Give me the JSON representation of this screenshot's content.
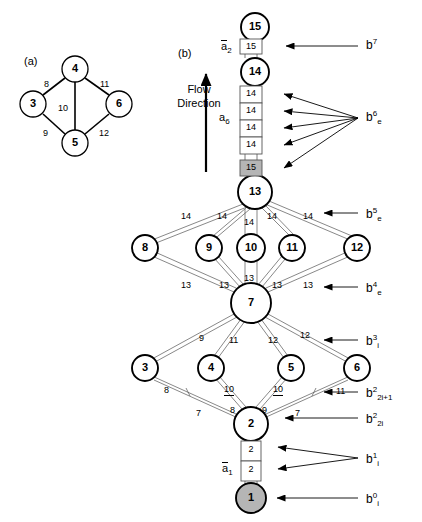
{
  "figure": {
    "panels": [
      {
        "tag": "(a)",
        "x": 24,
        "y": 56
      },
      {
        "tag": "(b)",
        "x": 178,
        "y": 48
      }
    ],
    "flow_label_line1": "Flow",
    "flow_label_line2": "Direction"
  },
  "panel_a": {
    "nodes": [
      {
        "id": "4",
        "cx": 75,
        "cy": 69,
        "r": 13
      },
      {
        "id": "3",
        "cx": 33,
        "cy": 104,
        "r": 13
      },
      {
        "id": "6",
        "cx": 119,
        "cy": 104,
        "r": 13
      },
      {
        "id": "5",
        "cx": 75,
        "cy": 143,
        "r": 13
      }
    ],
    "edges": [
      {
        "from": "3",
        "to": "4",
        "label": "8",
        "lx": 44,
        "ly": 80
      },
      {
        "from": "4",
        "to": "6",
        "label": "11",
        "lx": 100,
        "ly": 80
      },
      {
        "from": "4",
        "to": "5",
        "label": "10",
        "lx": 58,
        "ly": 104
      },
      {
        "from": "3",
        "to": "5",
        "label": "9",
        "lx": 43,
        "ly": 129
      },
      {
        "from": "5",
        "to": "6",
        "label": "12",
        "lx": 99,
        "ly": 129
      }
    ]
  },
  "panel_b": {
    "nodes": [
      {
        "id": "15",
        "cx": 255,
        "cy": 27,
        "r": 14,
        "fill": "white"
      },
      {
        "id": "14",
        "cx": 255,
        "cy": 72,
        "r": 14,
        "fill": "white"
      },
      {
        "id": "13",
        "cx": 255,
        "cy": 192,
        "r": 17,
        "fill": "white"
      },
      {
        "id": "8",
        "cx": 145,
        "cy": 248,
        "r": 13,
        "fill": "white"
      },
      {
        "id": "9",
        "cx": 209,
        "cy": 248,
        "r": 13,
        "fill": "white"
      },
      {
        "id": "10",
        "cx": 251,
        "cy": 248,
        "r": 14,
        "fill": "white"
      },
      {
        "id": "11",
        "cx": 292,
        "cy": 248,
        "r": 13,
        "fill": "white"
      },
      {
        "id": "12",
        "cx": 357,
        "cy": 248,
        "r": 13,
        "fill": "white"
      },
      {
        "id": "7",
        "cx": 251,
        "cy": 303,
        "r": 20,
        "fill": "white"
      },
      {
        "id": "3",
        "cx": 145,
        "cy": 368,
        "r": 13,
        "fill": "white"
      },
      {
        "id": "4",
        "cx": 211,
        "cy": 368,
        "r": 13,
        "fill": "white"
      },
      {
        "id": "5",
        "cx": 291,
        "cy": 368,
        "r": 13,
        "fill": "white"
      },
      {
        "id": "6",
        "cx": 357,
        "cy": 368,
        "r": 13,
        "fill": "white"
      },
      {
        "id": "2",
        "cx": 251,
        "cy": 424,
        "r": 17,
        "fill": "white"
      },
      {
        "id": "1",
        "cx": 251,
        "cy": 498,
        "r": 15,
        "fill": "#b5b5b5"
      }
    ],
    "stack_cells": [
      {
        "value": "15",
        "x": 240,
        "y": 39,
        "w": 22,
        "h": 15,
        "fill": "#ffffff"
      },
      {
        "value": "14",
        "x": 240,
        "y": 86,
        "w": 22,
        "h": 17,
        "fill": "#ffffff"
      },
      {
        "value": "14",
        "x": 240,
        "y": 103,
        "w": 22,
        "h": 17,
        "fill": "#ffffff"
      },
      {
        "value": "14",
        "x": 240,
        "y": 120,
        "w": 22,
        "h": 17,
        "fill": "#ffffff"
      },
      {
        "value": "14",
        "x": 240,
        "y": 137,
        "w": 22,
        "h": 17,
        "fill": "#ffffff"
      },
      {
        "value": "15",
        "x": 240,
        "y": 160,
        "w": 22,
        "h": 16,
        "fill": "#b5b5b5"
      },
      {
        "value": "2",
        "x": 241,
        "y": 441,
        "w": 20,
        "h": 20,
        "fill": "#ffffff"
      },
      {
        "value": "2",
        "x": 241,
        "y": 461,
        "w": 20,
        "h": 20,
        "fill": "#ffffff"
      }
    ],
    "a_labels": [
      {
        "text": "a",
        "sub": "2",
        "overline": true,
        "x": 221,
        "y": 40
      },
      {
        "text": "a",
        "sub": "6",
        "overline": false,
        "x": 219,
        "y": 112
      },
      {
        "text": "a",
        "sub": "1",
        "overline": true,
        "x": 222,
        "y": 462
      }
    ],
    "edge_labels": [
      {
        "text": "14",
        "x": 181,
        "y": 212
      },
      {
        "text": "14",
        "x": 217,
        "y": 212
      },
      {
        "text": "14",
        "x": 244,
        "y": 218
      },
      {
        "text": "14",
        "x": 267,
        "y": 212
      },
      {
        "text": "14",
        "x": 303,
        "y": 212
      },
      {
        "text": "13",
        "x": 181,
        "y": 281
      },
      {
        "text": "13",
        "x": 219,
        "y": 281
      },
      {
        "text": "13",
        "x": 244,
        "y": 274
      },
      {
        "text": "13",
        "x": 272,
        "y": 281
      },
      {
        "text": "13",
        "x": 303,
        "y": 281
      },
      {
        "text": "9",
        "x": 199,
        "y": 334
      },
      {
        "text": "11",
        "x": 229,
        "y": 336
      },
      {
        "text": "12",
        "x": 268,
        "y": 336
      },
      {
        "text": "12",
        "x": 300,
        "y": 331
      },
      {
        "text": "8",
        "x": 164,
        "y": 386
      },
      {
        "text": "10",
        "x": 224,
        "y": 385
      },
      {
        "text": "10",
        "x": 273,
        "y": 385
      },
      {
        "text": "11",
        "x": 336,
        "y": 387
      },
      {
        "text": "7",
        "x": 196,
        "y": 409
      },
      {
        "text": "8",
        "x": 230,
        "y": 406
      },
      {
        "text": "9",
        "x": 262,
        "y": 406
      },
      {
        "text": "7",
        "x": 295,
        "y": 409
      }
    ],
    "b_labels": [
      {
        "base": "b",
        "sup": "7",
        "sub": "",
        "x": 366,
        "y": 38
      },
      {
        "base": "b",
        "sup": "6",
        "sub": "e",
        "x": 366,
        "y": 110
      },
      {
        "base": "b",
        "sup": "5",
        "sub": "e",
        "x": 366,
        "y": 207
      },
      {
        "base": "b",
        "sup": "4",
        "sub": "e",
        "x": 366,
        "y": 281
      },
      {
        "base": "b",
        "sup": "3",
        "sub": "i",
        "x": 366,
        "y": 334
      },
      {
        "base": "b",
        "sup": "2",
        "sub": "2i+1",
        "x": 366,
        "y": 386
      },
      {
        "base": "b",
        "sup": "2",
        "sub": "2i",
        "x": 366,
        "y": 412
      },
      {
        "base": "b",
        "sup": "1",
        "sub": "i",
        "x": 366,
        "y": 452
      },
      {
        "base": "b",
        "sup": "0",
        "sub": "i",
        "x": 366,
        "y": 492
      }
    ],
    "arrows": [
      {
        "name": "b7-arrow",
        "x1": 358,
        "y1": 46,
        "x2": 284,
        "y2": 46
      },
      {
        "name": "b6-arrow-1",
        "x1": 358,
        "y1": 118,
        "x2": 281,
        "y2": 94
      },
      {
        "name": "b6-arrow-2",
        "x1": 358,
        "y1": 118,
        "x2": 281,
        "y2": 111
      },
      {
        "name": "b6-arrow-3",
        "x1": 358,
        "y1": 118,
        "x2": 281,
        "y2": 128
      },
      {
        "name": "b6-arrow-4",
        "x1": 358,
        "y1": 118,
        "x2": 281,
        "y2": 145
      },
      {
        "name": "b6-arrow-5",
        "x1": 358,
        "y1": 118,
        "x2": 281,
        "y2": 168
      },
      {
        "name": "b5-arrow",
        "x1": 358,
        "y1": 213,
        "x2": 322,
        "y2": 213
      },
      {
        "name": "b4-arrow",
        "x1": 358,
        "y1": 287,
        "x2": 322,
        "y2": 287
      },
      {
        "name": "b3-arrow",
        "x1": 358,
        "y1": 340,
        "x2": 322,
        "y2": 340
      },
      {
        "name": "b2odd-arrow",
        "x1": 358,
        "y1": 392,
        "x2": 322,
        "y2": 392
      },
      {
        "name": "b2even-arrow",
        "x1": 358,
        "y1": 418,
        "x2": 283,
        "y2": 418
      },
      {
        "name": "b1-arrow-1",
        "x1": 358,
        "y1": 458,
        "x2": 276,
        "y2": 447
      },
      {
        "name": "b1-arrow-2",
        "x1": 358,
        "y1": 458,
        "x2": 276,
        "y2": 469
      },
      {
        "name": "b0-arrow",
        "x1": 358,
        "y1": 498,
        "x2": 275,
        "y2": 498
      }
    ],
    "flow_arrow": {
      "x": 206,
      "y_top": 72,
      "y_bottom": 172
    }
  }
}
